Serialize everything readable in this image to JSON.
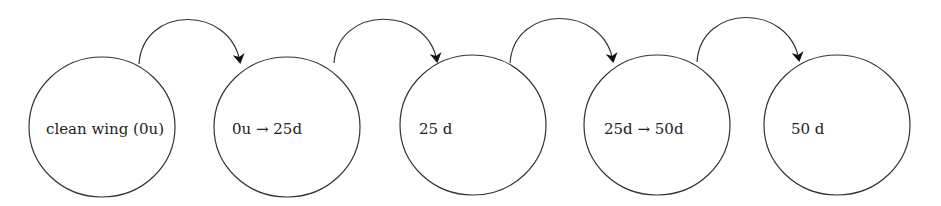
{
  "diagram": {
    "type": "state-sequence",
    "stroke_color": "#333333",
    "arrow_color": "#111111",
    "nodes": [
      {
        "id": "n1",
        "label": "clean wing (0u)",
        "cx": 102,
        "cy": 127,
        "rx": 73,
        "ry": 70,
        "label_x": 46,
        "label_y": 130
      },
      {
        "id": "n2",
        "label": "0u → 25d",
        "cx": 287,
        "cy": 127,
        "rx": 73,
        "ry": 70,
        "label_x": 232,
        "label_y": 130
      },
      {
        "id": "n3",
        "label": "25 d",
        "cx": 473,
        "cy": 125,
        "rx": 73,
        "ry": 70,
        "label_x": 419,
        "label_y": 130
      },
      {
        "id": "n4",
        "label": "25d → 50d",
        "cx": 657,
        "cy": 125,
        "rx": 73,
        "ry": 70,
        "label_x": 604,
        "label_y": 130
      },
      {
        "id": "n5",
        "label": "50 d",
        "cx": 837,
        "cy": 125,
        "rx": 73,
        "ry": 70,
        "label_x": 791,
        "label_y": 130
      }
    ],
    "edges": [
      {
        "from": "n1",
        "to": "n2",
        "start": [
          139,
          64
        ],
        "end": [
          240,
          62
        ],
        "peak_y": 19
      },
      {
        "from": "n2",
        "to": "n3",
        "start": [
          334,
          63
        ],
        "end": [
          437,
          61
        ],
        "peak_y": 19
      },
      {
        "from": "n3",
        "to": "n4",
        "start": [
          510,
          63
        ],
        "end": [
          613,
          61
        ],
        "peak_y": 18
      },
      {
        "from": "n4",
        "to": "n5",
        "start": [
          697,
          62
        ],
        "end": [
          799,
          60
        ],
        "peak_y": 17
      }
    ]
  }
}
